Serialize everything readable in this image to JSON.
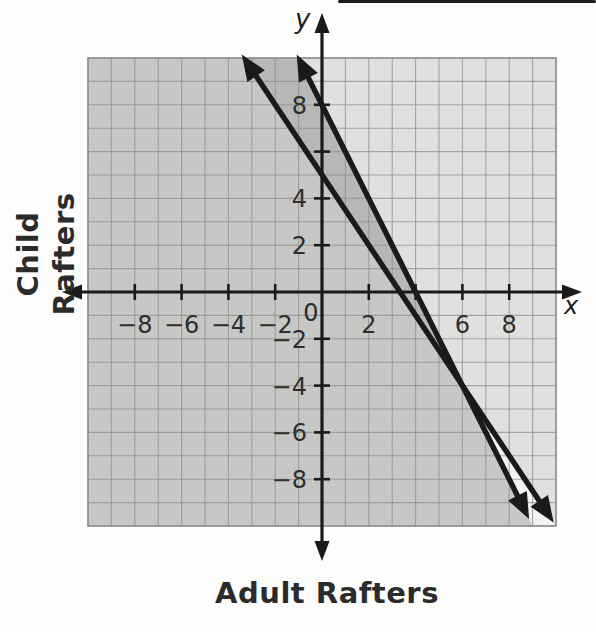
{
  "chart_data": {
    "type": "line",
    "title": "",
    "xlabel": "Adult Rafters",
    "ylabel": "Child Rafters",
    "x_axis_letter": "x",
    "y_axis_letter": "y",
    "xlim": [
      -10,
      10
    ],
    "ylim": [
      -10,
      10
    ],
    "grid_step": 1,
    "grid_on": true,
    "legend": "none",
    "x_tick_values": [
      -8,
      -6,
      -4,
      -2,
      2,
      4,
      6,
      8
    ],
    "y_tick_values": [
      -8,
      -6,
      -4,
      -2,
      2,
      4,
      6,
      8
    ],
    "x_tick_labels": [
      {
        "value": -8,
        "label": "−8"
      },
      {
        "value": -6,
        "label": "−6"
      },
      {
        "value": -4,
        "label": "−4"
      },
      {
        "value": -2,
        "label": "−2"
      },
      {
        "value": 2,
        "label": "2"
      },
      {
        "value": 6,
        "label": "6"
      },
      {
        "value": 8,
        "label": "8"
      }
    ],
    "y_tick_labels": [
      {
        "value": 8,
        "label": "8"
      },
      {
        "value": 4,
        "label": "4"
      },
      {
        "value": 2,
        "label": "2"
      },
      {
        "value": -2,
        "label": "−2"
      },
      {
        "value": -4,
        "label": "−4"
      },
      {
        "value": -6,
        "label": "−6"
      },
      {
        "value": -8,
        "label": "−8"
      }
    ],
    "origin_label": "0",
    "series": [
      {
        "name": "line-a",
        "equation": "y = -1.5x + 5",
        "slope": -1.5,
        "y_intercept": 5,
        "x_intercept": 3.33,
        "p1": [
          -3.43,
          10.15
        ],
        "p2": [
          9.9,
          -9.85
        ]
      },
      {
        "name": "line-b",
        "equation": "y = -2x + 8",
        "slope": -2,
        "y_intercept": 8,
        "x_intercept": 4,
        "p1": [
          -1.08,
          10.15
        ],
        "p2": [
          8.85,
          -9.7
        ]
      }
    ],
    "lines_intersection": [
      6,
      -4
    ],
    "shaded_regions": [
      {
        "name": "above-line-a",
        "inequality": "y >= -1.5x + 5",
        "polygon": [
          [
            -3.33,
            10
          ],
          [
            10,
            -10
          ],
          [
            10,
            10
          ]
        ],
        "fill": "#000000",
        "fill_opacity": 0.08
      },
      {
        "name": "below-line-b",
        "inequality": "y <= -2x + 8",
        "polygon": [
          [
            -1,
            10
          ],
          [
            -10,
            10
          ],
          [
            -10,
            -10
          ],
          [
            9,
            -10
          ]
        ],
        "fill": "#000000",
        "fill_opacity": 0.18
      }
    ],
    "colors": {
      "line": "#1a1a1a",
      "axis": "#1a1a1a",
      "grid": "#8f8f8f",
      "paper": "#f3f3f1",
      "tick_label": "#2e2e2e",
      "title": "#2b2b2b",
      "page": "#fdfdfc",
      "scan_artifact": "#1c1c1c"
    }
  }
}
